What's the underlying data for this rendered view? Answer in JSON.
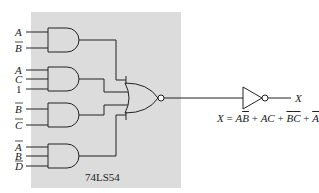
{
  "diagram": {
    "chip_label": "74LS54",
    "gates": [
      {
        "type": "AND",
        "inputs": [
          {
            "name": "A",
            "inverted": false
          },
          {
            "name": "B",
            "inverted": true
          }
        ]
      },
      {
        "type": "AND",
        "inputs": [
          {
            "name": "A",
            "inverted": false
          },
          {
            "name": "C",
            "inverted": false
          },
          {
            "name": "1",
            "inverted": false
          }
        ]
      },
      {
        "type": "AND",
        "inputs": [
          {
            "name": "B",
            "inverted": true
          },
          {
            "name": "C",
            "inverted": true
          }
        ]
      },
      {
        "type": "AND",
        "inputs": [
          {
            "name": "A",
            "inverted": true
          },
          {
            "name": "B",
            "inverted": false
          },
          {
            "name": "D",
            "inverted": true
          }
        ]
      }
    ],
    "nor_gate": "NOR",
    "inverter": "NOT",
    "output_label": "X",
    "equation": {
      "lhs": "X",
      "equals": "=",
      "terms": [
        "AB̄",
        "AC",
        "B̄C̄",
        "ĀBD̄"
      ],
      "plus": "+"
    },
    "labels": {
      "g1_in1": "A",
      "g1_in2": "B",
      "g2_in1": "A",
      "g2_in2": "C",
      "g2_in3": "1",
      "g3_in1": "B",
      "g3_in2": "C",
      "g4_in1": "A",
      "g4_in2": "B",
      "g4_in3": "D"
    },
    "colors": {
      "chip_fill": "#dcdcdc",
      "line": "#222222",
      "background": "#ffffff"
    }
  }
}
